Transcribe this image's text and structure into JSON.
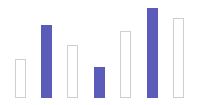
{
  "chart_data": {
    "type": "bar",
    "title": "",
    "xlabel": "",
    "ylabel": "",
    "categories": [
      "1",
      "2",
      "3",
      "4",
      "5",
      "6",
      "7"
    ],
    "values": [
      39,
      73,
      53,
      31,
      67,
      90,
      80
    ],
    "styles": [
      "outline",
      "filled",
      "outline",
      "filled",
      "outline",
      "filled",
      "outline"
    ],
    "ylim": [
      0,
      100
    ],
    "grid": false,
    "legend": null
  },
  "layout": {
    "baseline_y": 98,
    "bar_x": [
      15,
      41,
      67,
      94,
      120,
      147,
      173
    ],
    "bar_width": 11
  },
  "colors": {
    "fill": "#5b5bb9",
    "stroke": "#cfcfcf",
    "background": "#ffffff"
  }
}
